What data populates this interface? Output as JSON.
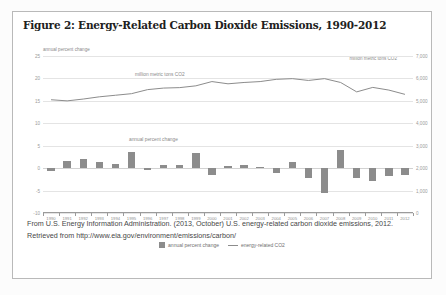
{
  "figure": {
    "title": "Figure 2: Energy-Related Carbon Dioxide Emissions, 1990-2012",
    "caption": "From U.S. Energy Information Administration. (2013, October) U.S. energy-related carbon dioxide emissions, 2012. Retrieved from http://www.eia.gov/environment/emissions/carbon/"
  },
  "chart_data": {
    "type": "bar",
    "title": "Figure 2: Energy-Related Carbon Dioxide Emissions, 1990-2012",
    "xlabel": "",
    "ylabel": "annual percent change",
    "y2label": "million metric tons CO2",
    "ylim": [
      -10,
      25
    ],
    "y2lim": [
      0,
      7000
    ],
    "yticks": [
      "25",
      "20",
      "15",
      "10",
      "5",
      "0",
      "-5",
      "-10"
    ],
    "ytick_values": [
      25,
      20,
      15,
      10,
      5,
      0,
      -5,
      -10
    ],
    "y2ticks": [
      "7,000",
      "6,000",
      "5,000",
      "4,000",
      "3,000",
      "2,000",
      "1,000",
      "0"
    ],
    "y2tick_values": [
      7000,
      6000,
      5000,
      4000,
      3000,
      2000,
      1000,
      0
    ],
    "grid": true,
    "legend_position": "bottom",
    "categories": [
      "1990",
      "1991",
      "1992",
      "1993",
      "1994",
      "1995",
      "1996",
      "1997",
      "1998",
      "1999",
      "2000",
      "2001",
      "2002",
      "2003",
      "2004",
      "2005",
      "2006",
      "2007",
      "2008",
      "2009",
      "2010",
      "2011",
      "2012"
    ],
    "annotations": [
      {
        "text": "million metric tons CO2",
        "target": "line"
      },
      {
        "text": "annual percent change",
        "target": "bars"
      }
    ],
    "series": [
      {
        "name": "annual percent change",
        "type": "bar",
        "axis": "left",
        "color": "#8c8c8c",
        "values": [
          -0.6,
          1.6,
          2.1,
          1.3,
          0.9,
          3.6,
          -0.4,
          0.6,
          0.7,
          3.4,
          -1.5,
          0.5,
          0.8,
          0.2,
          -1.1,
          1.3,
          -2.3,
          -5.6,
          4.1,
          -2.2,
          -2.9,
          -1.8,
          -1.6
        ]
      },
      {
        "name": "energy-related CO2",
        "type": "line",
        "axis": "right",
        "color": "#8c8c8c",
        "values": [
          5050,
          5000,
          5080,
          5180,
          5250,
          5320,
          5500,
          5570,
          5590,
          5670,
          5860,
          5760,
          5820,
          5860,
          5960,
          5990,
          5910,
          5990,
          5820,
          5400,
          5600,
          5480,
          5290
        ]
      }
    ]
  },
  "legend": [
    {
      "label": "annual percent change",
      "marker": "square"
    },
    {
      "label": "energy-related CO2",
      "marker": "line"
    }
  ]
}
